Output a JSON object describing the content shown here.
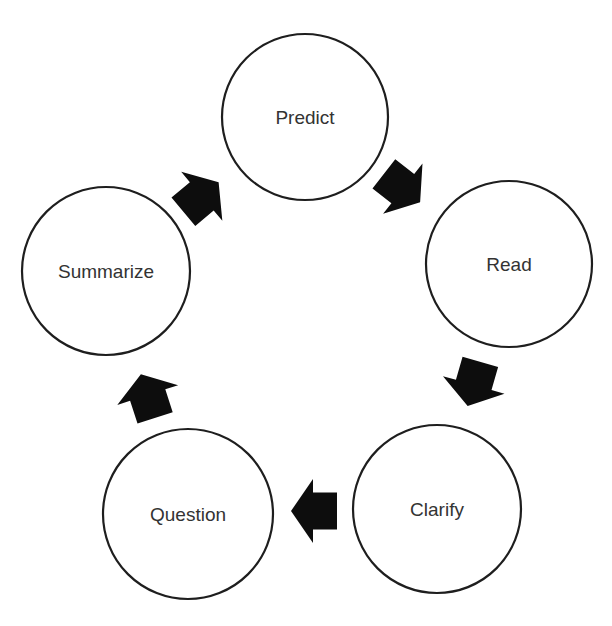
{
  "diagram": {
    "type": "cycle",
    "title": "",
    "stroke_color": "#1e1e1e",
    "label_color": "#333333",
    "arrow_color": "#0d0d0d",
    "background": "#ffffff",
    "nodes": [
      {
        "id": "predict",
        "label": "Predict",
        "cx": 305,
        "cy": 117,
        "r": 83
      },
      {
        "id": "read",
        "label": "Read",
        "cx": 509,
        "cy": 264,
        "r": 83
      },
      {
        "id": "clarify",
        "label": "Clarify",
        "cx": 437,
        "cy": 509,
        "r": 84
      },
      {
        "id": "question",
        "label": "Question",
        "cx": 188,
        "cy": 514,
        "r": 85
      },
      {
        "id": "summarize",
        "label": "Summarize",
        "cx": 106,
        "cy": 271,
        "r": 84
      }
    ],
    "edges": [
      {
        "from": "predict",
        "to": "read",
        "arrow": {
          "cx": 402,
          "cy": 188,
          "angle": 38
        }
      },
      {
        "from": "read",
        "to": "clarify",
        "arrow": {
          "cx": 474,
          "cy": 384,
          "angle": 106
        }
      },
      {
        "from": "clarify",
        "to": "question",
        "arrow": {
          "cx": 314,
          "cy": 511,
          "angle": 180
        }
      },
      {
        "from": "question",
        "to": "summarize",
        "arrow": {
          "cx": 148,
          "cy": 396,
          "angle": -108
        }
      },
      {
        "from": "summarize",
        "to": "predict",
        "arrow": {
          "cx": 201,
          "cy": 197,
          "angle": -40
        }
      }
    ]
  }
}
